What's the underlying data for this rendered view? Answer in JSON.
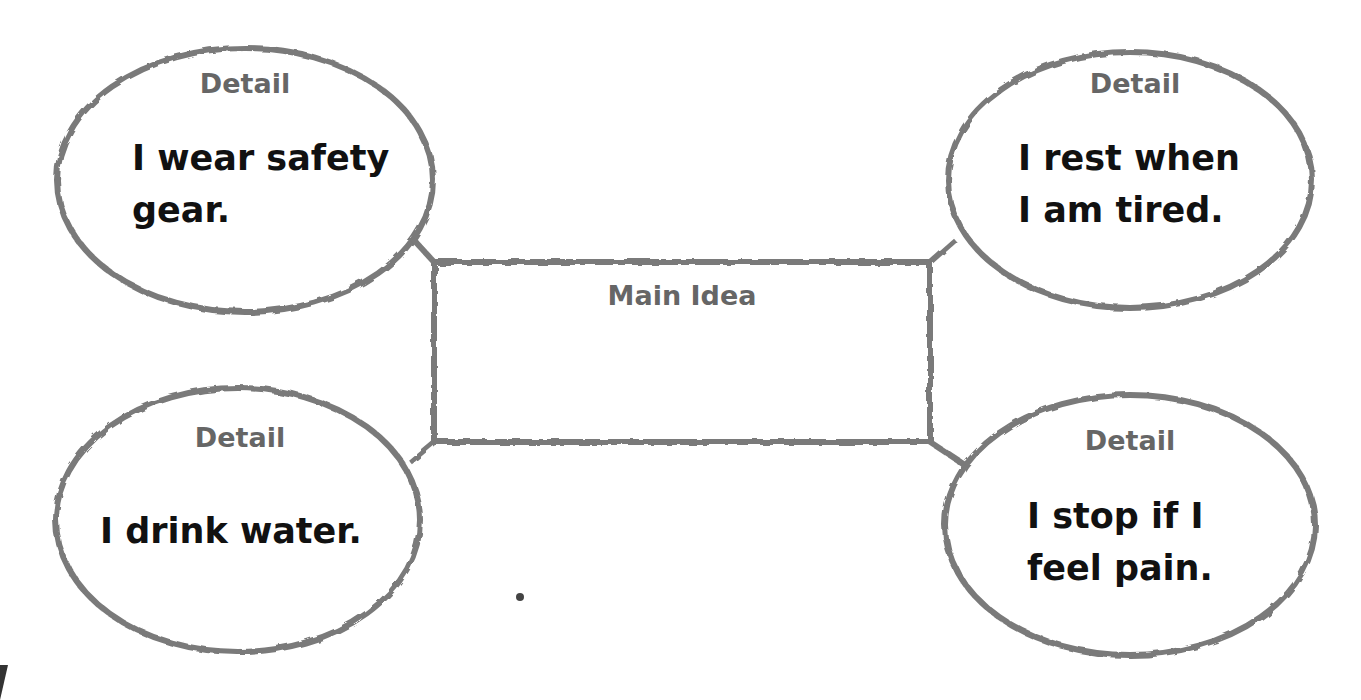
{
  "diagram": {
    "type": "main-idea-and-details organizer",
    "main_idea": {
      "label": "Main Idea",
      "text": ""
    },
    "details": [
      {
        "label": "Detail",
        "text_lines": [
          "I wear safety",
          "gear."
        ]
      },
      {
        "label": "Detail",
        "text_lines": [
          "I rest when",
          "I am tired."
        ]
      },
      {
        "label": "Detail",
        "text_lines": [
          "I drink water."
        ]
      },
      {
        "label": "Detail",
        "text_lines": [
          "I stop if I",
          "feel pain."
        ]
      }
    ],
    "colors": {
      "outline": "#7a7a7a",
      "label": "#666666",
      "text": "#111111",
      "background": "#ffffff"
    }
  }
}
